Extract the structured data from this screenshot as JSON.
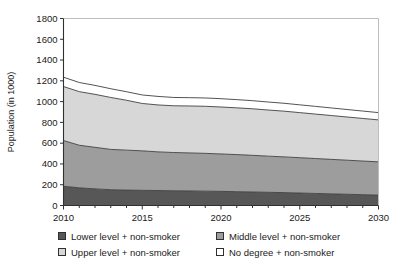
{
  "chart_data": {
    "type": "area",
    "stacked": true,
    "title": "",
    "xlabel": "",
    "ylabel": "Population (in 1000)",
    "xlim": [
      2010,
      2030
    ],
    "ylim": [
      0,
      1800
    ],
    "ytick_step": 200,
    "xtick_step": 1,
    "xtick_label_step": 5,
    "grid": false,
    "legend_position": "bottom",
    "x": [
      2010,
      2011,
      2012,
      2013,
      2014,
      2015,
      2016,
      2017,
      2018,
      2019,
      2020,
      2021,
      2022,
      2023,
      2024,
      2025,
      2026,
      2027,
      2028,
      2029,
      2030
    ],
    "xticks": [
      2010,
      2015,
      2020,
      2025,
      2030
    ],
    "xtick_labels": [
      "2010",
      "2015",
      "2020",
      "2025",
      "2030"
    ],
    "yticks": [
      0,
      200,
      400,
      600,
      800,
      1000,
      1200,
      1400,
      1600,
      1800
    ],
    "ytick_labels": [
      "0",
      "200",
      "400",
      "600",
      "800",
      "1000",
      "1200",
      "1400",
      "1600",
      "1800"
    ],
    "series": [
      {
        "name": "Lower level + non-smoker",
        "color": "#575757",
        "order": 1,
        "values": [
          185,
          170,
          160,
          152,
          148,
          146,
          144,
          142,
          140,
          138,
          136,
          133,
          130,
          127,
          124,
          120,
          116,
          112,
          108,
          104,
          100
        ]
      },
      {
        "name": "Middle level + non-smoker",
        "color": "#9d9d9d",
        "order": 2,
        "values": [
          440,
          410,
          400,
          388,
          385,
          380,
          372,
          368,
          366,
          364,
          360,
          357,
          353,
          348,
          344,
          340,
          336,
          332,
          328,
          324,
          320
        ]
      },
      {
        "name": "Upper level + non-smoker",
        "color": "#d7d7d7",
        "order": 3,
        "values": [
          520,
          516,
          510,
          500,
          480,
          456,
          452,
          450,
          452,
          453,
          452,
          450,
          448,
          444,
          440,
          434,
          428,
          422,
          416,
          410,
          404
        ]
      },
      {
        "name": "No degree + non-smoker",
        "color": "#ffffff",
        "order": 4,
        "values": [
          90,
          88,
          86,
          84,
          82,
          82,
          82,
          80,
          80,
          80,
          80,
          79,
          78,
          77,
          76,
          75,
          74,
          73,
          72,
          71,
          70
        ]
      }
    ],
    "totals": [
      1235,
      1184,
      1156,
      1124,
      1095,
      1064,
      1050,
      1040,
      1038,
      1035,
      1028,
      1019,
      1009,
      996,
      984,
      969,
      954,
      939,
      924,
      909,
      894
    ],
    "legend_entries": [
      {
        "label": "Lower level + non-smoker",
        "color": "#575757"
      },
      {
        "label": "Middle level + non-smoker",
        "color": "#9d9d9d"
      },
      {
        "label": "Upper level + non-smoker",
        "color": "#d7d7d7"
      },
      {
        "label": "No degree + non-smoker",
        "color": "#ffffff"
      }
    ]
  }
}
